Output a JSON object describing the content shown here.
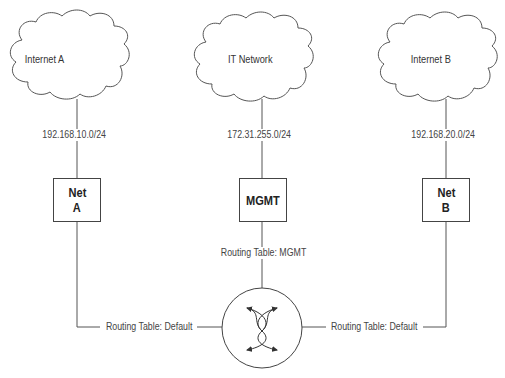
{
  "clouds": [
    {
      "id": "internet-a",
      "label": "Internet A"
    },
    {
      "id": "it-network",
      "label": "IT Network"
    },
    {
      "id": "internet-b",
      "label": "Internet B"
    }
  ],
  "subnets": {
    "a": "192.168.10.0/24",
    "mgmt": "172.31.255.0/24",
    "b": "192.168.20.0/24"
  },
  "nodes": {
    "net_a": {
      "line1": "Net",
      "line2": "A"
    },
    "mgmt": {
      "line1": "MGMT"
    },
    "net_b": {
      "line1": "Net",
      "line2": "B"
    }
  },
  "routing_tables": {
    "left": "Routing Table: Default",
    "center": "Routing Table: MGMT",
    "right": "Routing Table: Default"
  },
  "router": {
    "icon": "router-crossed-arrows-icon"
  }
}
